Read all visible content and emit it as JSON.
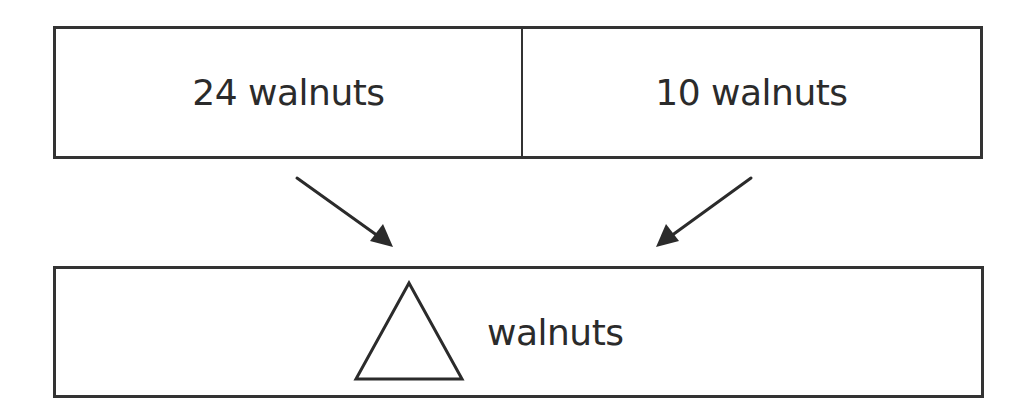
{
  "diagram": {
    "type": "part-part-whole bar model",
    "top_bar": {
      "parts": [
        {
          "label": "24 walnuts",
          "value": 24,
          "unit": "walnuts"
        },
        {
          "label": "10 walnuts",
          "value": 10,
          "unit": "walnuts"
        }
      ]
    },
    "bottom_bar": {
      "unknown_symbol": "triangle-icon",
      "label": "walnuts"
    },
    "arrows": [
      {
        "from": "part-1",
        "to": "whole",
        "direction": "down-right"
      },
      {
        "from": "part-2",
        "to": "whole",
        "direction": "down-left"
      }
    ],
    "colors": {
      "stroke": "#333333",
      "text": "#2b2b2b",
      "background": "#ffffff"
    }
  }
}
